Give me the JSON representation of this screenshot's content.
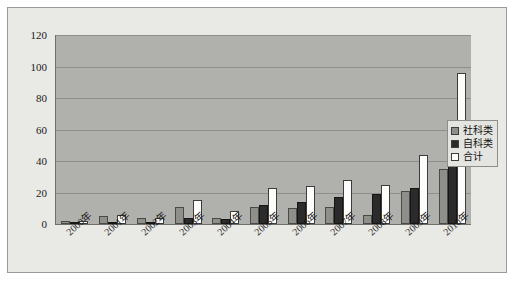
{
  "chart_data": {
    "type": "bar",
    "title": "",
    "subtitle": "",
    "xlabel": "",
    "ylabel": "",
    "ylim": [
      0,
      120
    ],
    "yticks": [
      0,
      20,
      40,
      60,
      80,
      100,
      120
    ],
    "grid": true,
    "legend_position": "right-inside",
    "categories": [
      "2000年",
      "2001年",
      "2002年",
      "2003年",
      "2004年",
      "2005年",
      "2006年",
      "2007年",
      "2008年",
      "2009年",
      "2010年"
    ],
    "series": [
      {
        "name": "社科类",
        "color": "#8e8e8a",
        "values": [
          2,
          5,
          4,
          11,
          4,
          11,
          10,
          11,
          6,
          21,
          35
        ]
      },
      {
        "name": "自科类",
        "color": "#2b2b2b",
        "values": [
          0,
          1,
          0,
          4,
          3,
          12,
          14,
          17,
          19,
          23,
          61
        ]
      },
      {
        "name": "合计",
        "color": "#fdfdfb",
        "values": [
          2,
          6,
          4,
          15,
          8,
          23,
          24,
          28,
          25,
          44,
          96
        ]
      }
    ]
  },
  "figure": {
    "background_color": "#e9e9e6",
    "plot_background_color": "#b0b0ac",
    "border_color": "#9a9a96",
    "gridline_color": "#8e8e8a",
    "axis_color": "#6e6e6a"
  }
}
